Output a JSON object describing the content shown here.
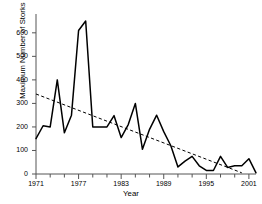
{
  "chart_data": {
    "type": "line",
    "title": "",
    "xlabel": "Year",
    "ylabel": "Maximum Number of Storks",
    "xlim": [
      1971,
      2002
    ],
    "ylim": [
      0,
      680
    ],
    "grid": false,
    "legend": null,
    "y_ticks": [
      0,
      100,
      200,
      300,
      400,
      500,
      600
    ],
    "x_ticks": [
      1971,
      1977,
      1983,
      1989,
      1995,
      2001
    ],
    "x_minor_tick_step": 2,
    "series": [
      {
        "name": "Maximum Number of Storks",
        "style": "solid",
        "color": "#000000",
        "x": [
          1971,
          1972,
          1973,
          1974,
          1975,
          1976,
          1977,
          1978,
          1979,
          1980,
          1981,
          1982,
          1983,
          1984,
          1985,
          1986,
          1987,
          1988,
          1989,
          1990,
          1991,
          1992,
          1993,
          1994,
          1995,
          1996,
          1997,
          1998,
          1999,
          2000,
          2001,
          2002
        ],
        "values": [
          150,
          205,
          200,
          400,
          175,
          250,
          610,
          650,
          200,
          200,
          200,
          248,
          155,
          210,
          300,
          105,
          190,
          250,
          180,
          120,
          30,
          55,
          75,
          35,
          15,
          15,
          75,
          28,
          35,
          35,
          65,
          5
        ]
      },
      {
        "name": "Linear trend",
        "style": "dashed",
        "color": "#000000",
        "x": [
          1971,
          2000
        ],
        "values": [
          340,
          5
        ]
      }
    ]
  },
  "axis": {
    "y_tick_labels": [
      "600",
      "500",
      "400",
      "300",
      "200",
      "100",
      "0"
    ],
    "x_tick_labels": [
      "1971",
      "1977",
      "1983",
      "1989",
      "1995",
      "2001"
    ],
    "x_axis_title": "Year",
    "y_axis_title": "Maximum Number of Storks"
  },
  "colors": {
    "line": "#000000",
    "trend": "#000000",
    "axis": "#555555",
    "background": "#ffffff"
  }
}
